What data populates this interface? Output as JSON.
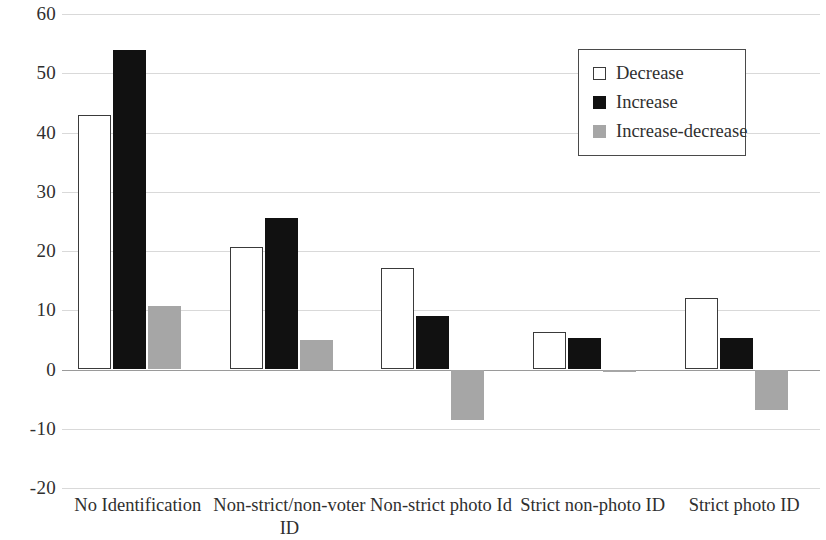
{
  "chart_data": {
    "type": "bar",
    "title": "",
    "subtitle": "",
    "xlabel": "",
    "ylabel": "",
    "ylim": [
      -20,
      60
    ],
    "ytick_step": 10,
    "yticks": [
      60,
      50,
      40,
      30,
      20,
      10,
      0,
      -10,
      -20
    ],
    "ytick_labels": [
      "60",
      "50",
      "40",
      "30",
      "20",
      "10",
      "0",
      "-10",
      "-20"
    ],
    "grid": true,
    "grid_axis": "y",
    "legend_position": "top-right",
    "categories": [
      "No Identification",
      "Non-strict/non-voter ID",
      "Non-strict photo Id",
      "Strict non-photo ID",
      "Strict photo ID"
    ],
    "series": [
      {
        "name": "Decrease",
        "color": "#ffffff",
        "edge_color": "#3a3a3a",
        "values": [
          43.0,
          20.6,
          17.2,
          6.3,
          12.0
        ]
      },
      {
        "name": "Increase",
        "color": "#111111",
        "edge_color": "#111111",
        "values": [
          54.0,
          25.6,
          9.0,
          5.3,
          5.3
        ]
      },
      {
        "name": "Increase-decrease",
        "color": "#a6a6a6",
        "edge_color": "#a6a6a6",
        "values": [
          10.8,
          5.0,
          -8.5,
          -0.4,
          -6.8
        ]
      }
    ]
  },
  "legend": {
    "items": [
      {
        "label": "Decrease",
        "swatch": "decrease"
      },
      {
        "label": "Increase",
        "swatch": "increase"
      },
      {
        "label": "Increase-decrease",
        "swatch": "increase-decrease"
      }
    ]
  },
  "colors": {
    "decrease": "#ffffff",
    "decrease_edge": "#3a3a3a",
    "increase": "#111111",
    "increase_decrease": "#a6a6a6",
    "gridline": "#d9d9d9",
    "zero_line": "#9a9a9a",
    "text": "#2f2f2f",
    "background": "#ffffff"
  }
}
